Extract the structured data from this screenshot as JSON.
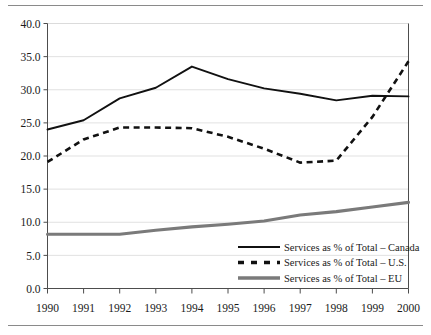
{
  "chart_data": {
    "type": "line",
    "title": "",
    "xlabel": "",
    "ylabel": "",
    "grid": true,
    "legend_position": "inside-bottom-right",
    "x": [
      1990,
      1991,
      1992,
      1993,
      1994,
      1995,
      1996,
      1997,
      1998,
      1999,
      2000
    ],
    "categories": [
      "1990",
      "1991",
      "1992",
      "1993",
      "1994",
      "1995",
      "1996",
      "1997",
      "1998",
      "1999",
      "2000"
    ],
    "xlim": [
      1990,
      2000
    ],
    "ylim": [
      0.0,
      40.0
    ],
    "ytick_labels": [
      "0.0",
      "5.0",
      "10.0",
      "15.0",
      "20.0",
      "25.0",
      "30.0",
      "35.0",
      "40.0"
    ],
    "ytick_values": [
      0.0,
      5.0,
      10.0,
      15.0,
      20.0,
      25.0,
      30.0,
      35.0,
      40.0
    ],
    "series": [
      {
        "name": "Services as % of Total – Canada",
        "style": "solid",
        "color": "#111111",
        "values": [
          24.0,
          25.4,
          28.7,
          30.3,
          33.5,
          31.6,
          30.2,
          29.4,
          28.4,
          29.1,
          29.0
        ]
      },
      {
        "name": "Services as % of Total – U.S.",
        "style": "dashed",
        "color": "#111111",
        "values": [
          19.1,
          22.5,
          24.3,
          24.3,
          24.2,
          22.9,
          21.1,
          19.0,
          19.3,
          25.9,
          34.3
        ]
      },
      {
        "name": "Services as % of Total – EU",
        "style": "thick-solid",
        "color": "#7a7a7a",
        "values": [
          8.2,
          8.2,
          8.2,
          8.8,
          9.3,
          9.7,
          10.2,
          11.1,
          11.6,
          12.3,
          13.0
        ]
      }
    ]
  },
  "legend": {
    "items": [
      {
        "label": "Services as % of Total – Canada",
        "swatch": "solid-line-swatch"
      },
      {
        "label": "Services as % of Total – U.S.",
        "swatch": "dashed-line-swatch"
      },
      {
        "label": "Services as % of Total – EU",
        "swatch": "thick-gray-line-swatch"
      }
    ]
  },
  "colors": {
    "canada": "#111111",
    "us": "#111111",
    "eu": "#7a7a7a",
    "grid": "#d9d9d9",
    "axis": "#4d4d4d",
    "background": "#ffffff"
  }
}
